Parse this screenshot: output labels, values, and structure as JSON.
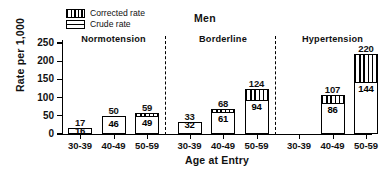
{
  "chart_data": {
    "type": "bar",
    "title": "Men",
    "xlabel": "Age at Entry",
    "ylabel": "Rate per 1,000",
    "ylim": [
      0,
      250
    ],
    "yticks": [
      0,
      50,
      100,
      150,
      200,
      250
    ],
    "grid": false,
    "legend_position": "top-left",
    "legend": [
      {
        "key": "corrected",
        "label": "Corrected rate",
        "pattern": "vertical-hatch"
      },
      {
        "key": "crude",
        "label": "Crude rate",
        "pattern": "open"
      }
    ],
    "groups": [
      {
        "name": "Normotension",
        "categories": [
          "30-39",
          "40-49",
          "50-59"
        ],
        "corrected": [
          17,
          50,
          59
        ],
        "crude": [
          16,
          46,
          49
        ]
      },
      {
        "name": "Borderline",
        "categories": [
          "30-39",
          "40-49",
          "50-59"
        ],
        "corrected": [
          33,
          68,
          124
        ],
        "crude": [
          32,
          61,
          94
        ]
      },
      {
        "name": "Hypertension",
        "categories": [
          "30-39",
          "40-49",
          "50-59"
        ],
        "corrected": [
          null,
          107,
          220
        ],
        "crude": [
          null,
          86,
          144
        ]
      }
    ],
    "categories": [
      "30-39",
      "40-49",
      "50-59",
      "30-39",
      "40-49",
      "50-59",
      "30-39",
      "40-49",
      "50-59"
    ],
    "series": [
      {
        "name": "Corrected rate",
        "values": [
          17,
          50,
          59,
          33,
          68,
          124,
          null,
          107,
          220
        ]
      },
      {
        "name": "Crude rate",
        "values": [
          16,
          46,
          49,
          32,
          61,
          94,
          null,
          86,
          144
        ]
      }
    ],
    "colors": {
      "outline": "#000000",
      "fill": "#ffffff",
      "background": "#ffffff"
    }
  }
}
